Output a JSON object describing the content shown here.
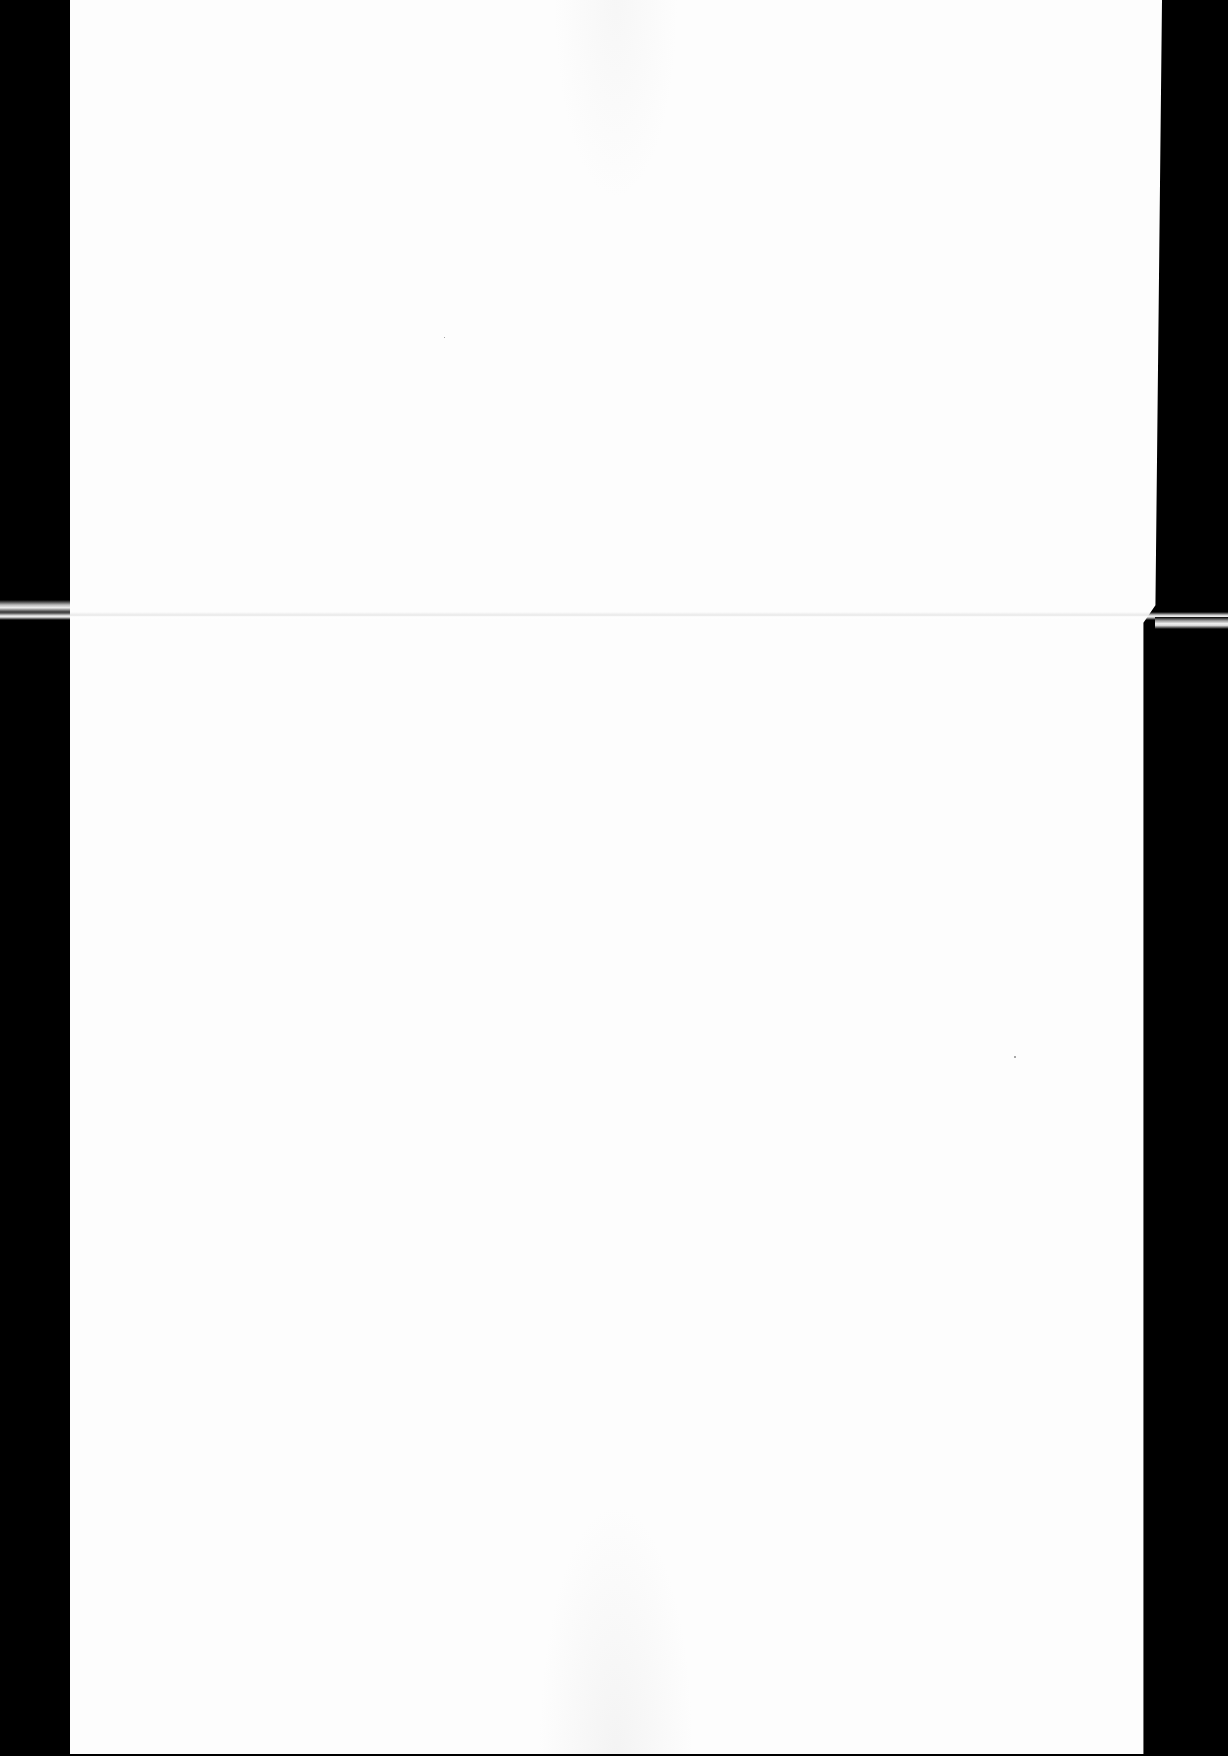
{
  "document": {
    "type": "scanned-blank-page",
    "text_content": "",
    "page_color": "#fdfdfd",
    "background_color": "#000000",
    "features": {
      "fold_crease": true,
      "fold_position_y": 615
    }
  }
}
